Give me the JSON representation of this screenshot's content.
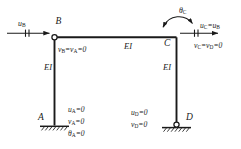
{
  "diagram": {
    "type": "structural-frame-boundary-conditions",
    "nodes": {
      "a": "A",
      "b": "B",
      "c": "C",
      "d": "D"
    },
    "members": {
      "left_column_label": "EI",
      "beam_label": "EI",
      "right_column_label": "EI"
    },
    "loads": {
      "applied_displacement_label": "u",
      "applied_displacement_sub": "B",
      "rotation_label": "θ",
      "rotation_sub": "C"
    },
    "constraints": {
      "node_b": {
        "text": "v",
        "sub1": "B",
        "mid": "=v",
        "sub2": "A",
        "end": "=0"
      },
      "node_c_horizontal": {
        "text": "u",
        "sub1": "C",
        "mid": "=u",
        "sub2": "B",
        "end": ""
      },
      "node_c_vertical": {
        "text": "v",
        "sub1": "C",
        "mid": "=v",
        "sub2": "D",
        "end": "=0"
      },
      "node_a": [
        {
          "sym": "u",
          "sub": "A",
          "val": "=0"
        },
        {
          "sym": "v",
          "sub": "A",
          "val": "=0"
        },
        {
          "sym": "θ",
          "sub": "A",
          "val": "=0"
        }
      ],
      "node_d": [
        {
          "sym": "u",
          "sub": "D",
          "val": "=0"
        },
        {
          "sym": "v",
          "sub": "D",
          "val": "=0"
        }
      ]
    },
    "supports": {
      "a_type": "fixed-support",
      "d_type": "pin-support"
    },
    "colors": {
      "line": "#1a1a1a",
      "text": "#1a1a1a",
      "background": "#ffffff"
    }
  }
}
